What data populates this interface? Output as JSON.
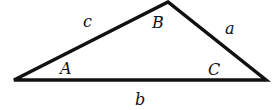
{
  "diagram": {
    "type": "triangle",
    "stroke_color": "#111111",
    "background": "#ffffff",
    "vertices": {
      "A": {
        "x": 14,
        "y": 80
      },
      "B": {
        "x": 168,
        "y": 2
      },
      "C": {
        "x": 266,
        "y": 80
      }
    },
    "angle_labels": {
      "A": "A",
      "B": "B",
      "C": "C"
    },
    "side_labels": {
      "a": "a",
      "b": "b",
      "c": "c"
    }
  }
}
